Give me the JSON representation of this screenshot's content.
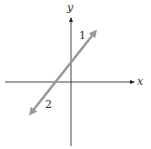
{
  "diagram": {
    "type": "coordinate-plane",
    "axes": {
      "x_label": "x",
      "y_label": "y",
      "color": "#222222"
    },
    "line": {
      "color": "#999999",
      "arrows": "both",
      "slope_sign": "positive",
      "y_intercept_sign": "positive",
      "x_intercept_sign": "negative"
    },
    "labels": {
      "upper": "1",
      "lower": "2"
    }
  }
}
